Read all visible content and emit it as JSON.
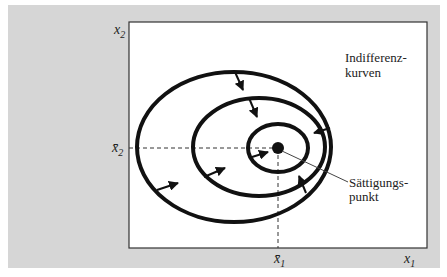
{
  "figure": {
    "type": "indifference-curves-satiation",
    "axes": {
      "x_label": "x",
      "x_sub": "1",
      "y_label": "x",
      "y_sub": "2",
      "x_marker": "x̄",
      "x_marker_sub": "1",
      "y_marker": "x̄",
      "y_marker_sub": "2"
    },
    "annotations": {
      "curves_label_line1": "Indifferenz-",
      "curves_label_line2": "kurven",
      "satiation_label_line1": "Sättigungs-",
      "satiation_label_line2": "punkt"
    },
    "colors": {
      "panel_background": "#d6d6d6",
      "plot_background": "#ffffff",
      "curve": "#111111"
    },
    "curves": [
      {
        "name": "outer",
        "cx": 234,
        "cy": 147,
        "rx": 97,
        "ry": 75
      },
      {
        "name": "middle",
        "cx": 259,
        "cy": 147,
        "rx": 66,
        "ry": 49
      },
      {
        "name": "inner",
        "cx": 278,
        "cy": 148,
        "rx": 30,
        "ry": 24
      }
    ],
    "satiation_point": {
      "x": 278,
      "y": 148
    }
  }
}
